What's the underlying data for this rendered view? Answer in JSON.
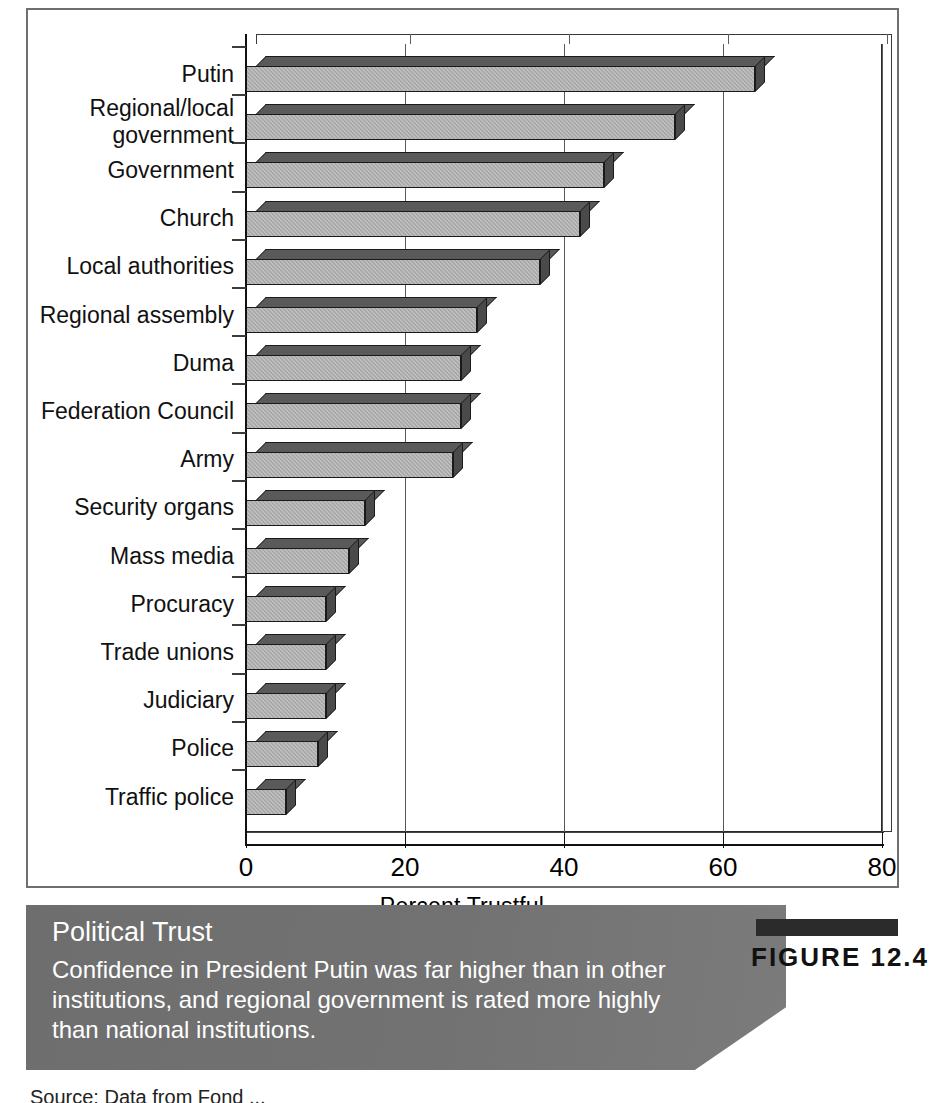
{
  "figure": {
    "badge_label": "FIGURE 12.4",
    "caption_title": "Political Trust",
    "caption_text": "Confidence in President Putin was far higher than in other institutions, and regional government is rated more highly than national institutions.",
    "source_line": "Source:  Data from Fond ..."
  },
  "chart_data": {
    "type": "bar",
    "orientation": "horizontal",
    "title": "Political Trust",
    "xlabel": "Percent Trustful",
    "ylabel": "",
    "xlim": [
      0,
      80
    ],
    "xticks": [
      0,
      20,
      40,
      60,
      80
    ],
    "xtick_labels": [
      "0",
      "20",
      "40",
      "60",
      "80"
    ],
    "grid": true,
    "grid_axis": "x",
    "legend": false,
    "bar_color": "#a8a8a8",
    "bar_edge_color": "#1a1a1a",
    "categories": [
      "Putin",
      "Regional/local government",
      "Government",
      "Church",
      "Local authorities",
      "Regional assembly",
      "Duma",
      "Federation Council",
      "Army",
      "Security organs",
      "Mass media",
      "Procuracy",
      "Trade unions",
      "Judiciary",
      "Police",
      "Traffic police"
    ],
    "values": [
      64,
      54,
      45,
      42,
      37,
      29,
      27,
      27,
      26,
      15,
      13,
      10,
      10,
      10,
      9,
      5
    ],
    "bars": [
      {
        "label": "Putin",
        "label_lines": [
          "Putin"
        ],
        "value": 64
      },
      {
        "label": "Regional/local government",
        "label_lines": [
          "Regional/local",
          "government"
        ],
        "value": 54
      },
      {
        "label": "Government",
        "label_lines": [
          "Government"
        ],
        "value": 45
      },
      {
        "label": "Church",
        "label_lines": [
          "Church"
        ],
        "value": 42
      },
      {
        "label": "Local authorities",
        "label_lines": [
          "Local authorities"
        ],
        "value": 37
      },
      {
        "label": "Regional assembly",
        "label_lines": [
          "Regional assembly"
        ],
        "value": 29
      },
      {
        "label": "Duma",
        "label_lines": [
          "Duma"
        ],
        "value": 27
      },
      {
        "label": "Federation Council",
        "label_lines": [
          "Federation Council"
        ],
        "value": 27
      },
      {
        "label": "Army",
        "label_lines": [
          "Army"
        ],
        "value": 26
      },
      {
        "label": "Security organs",
        "label_lines": [
          "Security organs"
        ],
        "value": 15
      },
      {
        "label": "Mass media",
        "label_lines": [
          "Mass media"
        ],
        "value": 13
      },
      {
        "label": "Procuracy",
        "label_lines": [
          "Procuracy"
        ],
        "value": 10
      },
      {
        "label": "Trade unions",
        "label_lines": [
          "Trade unions"
        ],
        "value": 10
      },
      {
        "label": "Judiciary",
        "label_lines": [
          "Judiciary"
        ],
        "value": 10
      },
      {
        "label": "Police",
        "label_lines": [
          "Police"
        ],
        "value": 9
      },
      {
        "label": "Traffic police",
        "label_lines": [
          "Traffic police"
        ],
        "value": 5
      }
    ]
  }
}
